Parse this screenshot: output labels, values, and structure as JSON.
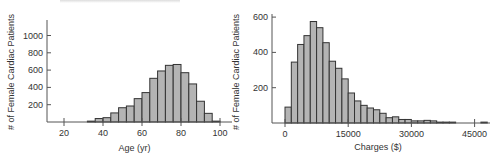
{
  "chart_data": [
    {
      "type": "bar",
      "title": "",
      "xlabel": "Age (yr)",
      "ylabel": "# of Female Cardiac Patients",
      "bin_width": 4,
      "bin_starts": [
        32,
        36,
        40,
        44,
        48,
        52,
        56,
        60,
        64,
        68,
        72,
        76,
        80,
        84,
        88,
        92,
        96
      ],
      "values": [
        10,
        40,
        50,
        105,
        165,
        185,
        270,
        340,
        505,
        590,
        655,
        665,
        570,
        440,
        240,
        100,
        10
      ],
      "xlim": [
        12,
        104
      ],
      "ylim": [
        0,
        1150
      ],
      "xticks": [
        20,
        40,
        60,
        80,
        100
      ],
      "yticks": [
        200,
        400,
        600,
        800,
        1000
      ],
      "grid": false,
      "legend": null
    },
    {
      "type": "bar",
      "title": "",
      "xlabel": "Charges ($)",
      "ylabel": "# of Female Cardiac Patients",
      "bin_width": 1500,
      "bin_starts": [
        0,
        1500,
        3000,
        4500,
        6000,
        7500,
        9000,
        10500,
        12000,
        13500,
        15000,
        16500,
        18000,
        19500,
        21000,
        22500,
        24000,
        25500,
        27000,
        28500,
        30000,
        31500,
        33000,
        34500,
        36000,
        37500,
        39000,
        46500
      ],
      "values": [
        90,
        345,
        445,
        495,
        575,
        540,
        455,
        350,
        310,
        250,
        170,
        125,
        100,
        85,
        75,
        55,
        30,
        35,
        20,
        20,
        12,
        12,
        15,
        12,
        5,
        5,
        5,
        5
      ],
      "xlim": [
        -3000,
        48000
      ],
      "ylim": [
        0,
        650
      ],
      "xticks": [
        0,
        15000,
        30000,
        45000
      ],
      "yticks": [
        200,
        400,
        600
      ],
      "grid": false,
      "legend": null
    }
  ],
  "left": {
    "ylabel": "# of Female Cardiac Patients",
    "xlabel": "Age (yr)",
    "yticks": [
      "200",
      "400",
      "600",
      "800",
      "1000"
    ],
    "xticks": [
      "20",
      "40",
      "60",
      "80",
      "100"
    ]
  },
  "right": {
    "ylabel": "# of Female Cardiac Patients",
    "xlabel": "Charges ($)",
    "yticks": [
      "200",
      "400",
      "600"
    ],
    "xticks": [
      "0",
      "15000",
      "30000",
      "45000"
    ]
  },
  "colors": {
    "bar_fill": "#b4b4b4",
    "bar_stroke": "#333333",
    "axis": "#555555"
  }
}
